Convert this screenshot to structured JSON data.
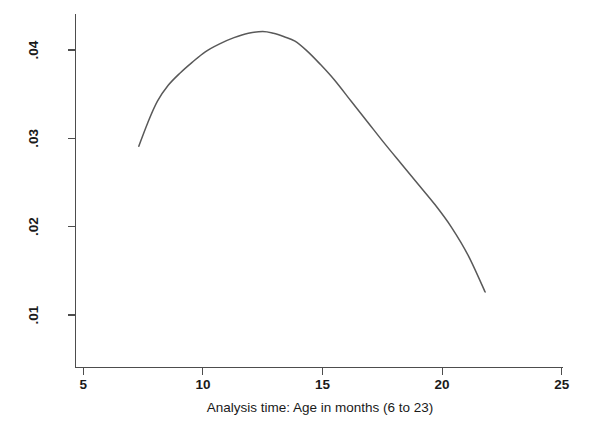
{
  "figure": {
    "background_color": "#ffffff",
    "line_color": "#595959",
    "axis_color": "#4d4d4d",
    "text_color": "#1a1a1a"
  },
  "chart_data": {
    "type": "line",
    "title": "",
    "subtitle": "",
    "xlabel": "Analysis time: Age in months (6 to 23)",
    "ylabel": "",
    "xlim": [
      5,
      25
    ],
    "ylim": [
      0.01,
      0.0455
    ],
    "grid": false,
    "legend": "none",
    "x_ticks": [
      5,
      10,
      15,
      20,
      25
    ],
    "x_tick_labels": [
      "5",
      "10",
      "15",
      "20",
      "25"
    ],
    "y_ticks": [
      0.01,
      0.02,
      0.03,
      0.04
    ],
    "y_tick_labels": [
      ".01",
      ".02",
      ".03",
      ".04"
    ],
    "y_tick_label_rotation": -90,
    "series": [
      {
        "name": "Smoothed hazard estimate",
        "x": [
          7.32,
          7.7,
          8.1,
          8.55,
          9.05,
          9.55,
          10.1,
          10.7,
          11.3,
          11.9,
          12.5,
          12.95,
          13.4,
          13.85,
          14.35,
          14.9,
          15.5,
          16.2,
          16.9,
          17.6,
          18.3,
          19.0,
          19.7,
          20.4,
          21.1,
          21.8
        ],
        "y": [
          0.0291,
          0.0318,
          0.0342,
          0.036,
          0.0374,
          0.0386,
          0.0398,
          0.0407,
          0.0414,
          0.0419,
          0.0421,
          0.0419,
          0.0415,
          0.041,
          0.0399,
          0.0384,
          0.0366,
          0.0342,
          0.0318,
          0.0294,
          0.0271,
          0.0248,
          0.0225,
          0.0199,
          0.0167,
          0.0126
        ]
      }
    ],
    "annotations": []
  },
  "axes": {
    "x_axis_name": "x-axis",
    "y_axis_name": "y-axis"
  }
}
